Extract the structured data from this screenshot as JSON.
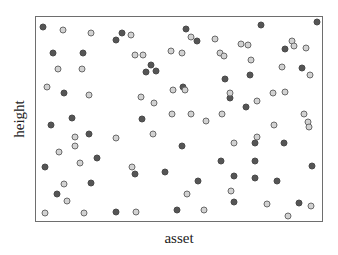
{
  "chart_data": {
    "type": "scatter",
    "title": "",
    "xlabel": "asset",
    "ylabel": "height",
    "grid": false,
    "legend": null,
    "axis_ticks": "none",
    "xlim": [
      0,
      1
    ],
    "ylim": [
      0,
      1
    ],
    "colors": {
      "dark": "#555555",
      "light": "#d2d2d2",
      "light_edge": "#6a6a6a",
      "frame": "#6e6e6e"
    },
    "series": [
      {
        "name": "dark",
        "marker": "filled-dark-circle",
        "points": [
          [
            0.024,
            0.951
          ],
          [
            0.059,
            0.825
          ],
          [
            0.163,
            0.825
          ],
          [
            0.281,
            0.886
          ],
          [
            0.403,
            0.767
          ],
          [
            0.302,
            0.922
          ],
          [
            0.385,
            0.728
          ],
          [
            0.42,
            0.733
          ],
          [
            0.524,
            0.942
          ],
          [
            0.563,
            0.883
          ],
          [
            0.514,
            0.655
          ],
          [
            0.66,
            0.694
          ],
          [
            0.788,
            0.961
          ],
          [
            0.983,
            0.976
          ],
          [
            0.872,
            0.845
          ],
          [
            0.931,
            0.748
          ],
          [
            0.747,
            0.714
          ],
          [
            0.677,
            0.602
          ],
          [
            0.736,
            0.558
          ],
          [
            0.097,
            0.627
          ],
          [
            0.125,
            0.506
          ],
          [
            0.052,
            0.471
          ],
          [
            0.184,
            0.427
          ],
          [
            0.372,
            0.5
          ],
          [
            0.215,
            0.311
          ],
          [
            0.031,
            0.267
          ],
          [
            0.345,
            0.228
          ],
          [
            0.51,
            0.369
          ],
          [
            0.646,
            0.296
          ],
          [
            0.451,
            0.238
          ],
          [
            0.074,
            0.131
          ],
          [
            0.194,
            0.184
          ],
          [
            0.278,
            0.044
          ],
          [
            0.493,
            0.053
          ],
          [
            0.566,
            0.194
          ],
          [
            0.764,
            0.296
          ],
          [
            0.965,
            0.272
          ],
          [
            0.764,
            0.383
          ],
          [
            0.868,
            0.383
          ],
          [
            0.764,
            0.209
          ],
          [
            0.694,
            0.22
          ],
          [
            0.92,
            0.087
          ],
          [
            0.691,
            0.092
          ],
          [
            0.844,
            0.194
          ]
        ]
      },
      {
        "name": "light",
        "marker": "light-gray-ring",
        "points": [
          [
            0.094,
            0.937
          ],
          [
            0.191,
            0.922
          ],
          [
            0.333,
            0.913
          ],
          [
            0.347,
            0.816
          ],
          [
            0.076,
            0.743
          ],
          [
            0.16,
            0.743
          ],
          [
            0.542,
            0.903
          ],
          [
            0.625,
            0.893
          ],
          [
            0.472,
            0.835
          ],
          [
            0.375,
            0.816
          ],
          [
            0.51,
            0.825
          ],
          [
            0.642,
            0.825
          ],
          [
            0.656,
            0.811
          ],
          [
            0.717,
            0.869
          ],
          [
            0.894,
            0.883
          ],
          [
            0.743,
            0.864
          ],
          [
            0.903,
            0.859
          ],
          [
            0.944,
            0.849
          ],
          [
            0.753,
            0.791
          ],
          [
            0.861,
            0.757
          ],
          [
            0.958,
            0.714
          ],
          [
            0.677,
            0.626
          ],
          [
            0.83,
            0.626
          ],
          [
            0.038,
            0.655
          ],
          [
            0.184,
            0.617
          ],
          [
            0.368,
            0.607
          ],
          [
            0.413,
            0.578
          ],
          [
            0.479,
            0.641
          ],
          [
            0.521,
            0.641
          ],
          [
            0.774,
            0.587
          ],
          [
            0.872,
            0.631
          ],
          [
            0.474,
            0.524
          ],
          [
            0.542,
            0.524
          ],
          [
            0.594,
            0.49
          ],
          [
            0.649,
            0.524
          ],
          [
            0.938,
            0.524
          ],
          [
            0.951,
            0.485
          ],
          [
            0.833,
            0.47
          ],
          [
            0.41,
            0.427
          ],
          [
            0.278,
            0.408
          ],
          [
            0.135,
            0.413
          ],
          [
            0.08,
            0.34
          ],
          [
            0.135,
            0.369
          ],
          [
            0.153,
            0.282
          ],
          [
            0.336,
            0.267
          ],
          [
            0.694,
            0.384
          ],
          [
            0.771,
            0.413
          ],
          [
            0.955,
            0.463
          ],
          [
            0.097,
            0.18
          ],
          [
            0.108,
            0.097
          ],
          [
            0.031,
            0.039
          ],
          [
            0.167,
            0.039
          ],
          [
            0.351,
            0.044
          ],
          [
            0.528,
            0.131
          ],
          [
            0.681,
            0.146
          ],
          [
            0.587,
            0.053
          ],
          [
            0.809,
            0.083
          ],
          [
            0.882,
            0.024
          ],
          [
            0.962,
            0.073
          ]
        ]
      }
    ]
  }
}
